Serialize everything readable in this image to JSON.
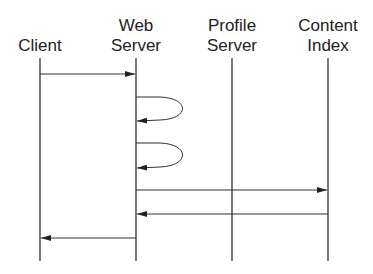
{
  "diagram": {
    "type": "sequence",
    "participants": [
      {
        "id": "client",
        "line1": "",
        "line2": "Client",
        "x": 40
      },
      {
        "id": "web",
        "line1": "Web",
        "line2": "Server",
        "x": 136
      },
      {
        "id": "profile",
        "line1": "Profile",
        "line2": "Server",
        "x": 232
      },
      {
        "id": "content",
        "line1": "Content",
        "line2": "Index",
        "x": 328
      }
    ],
    "messages": [
      {
        "from": "client",
        "to": "web",
        "y": 74
      },
      {
        "from": "web",
        "to": "web",
        "self": true,
        "y1": 97,
        "y2": 120
      },
      {
        "from": "web",
        "to": "web",
        "self": true,
        "y1": 143,
        "y2": 167
      },
      {
        "from": "web",
        "to": "content",
        "y": 190
      },
      {
        "from": "content",
        "to": "web",
        "y": 214
      },
      {
        "from": "web",
        "to": "client",
        "y": 238
      }
    ],
    "colors": {
      "line": "#333333",
      "text": "#222222",
      "background": "#ffffff"
    }
  }
}
